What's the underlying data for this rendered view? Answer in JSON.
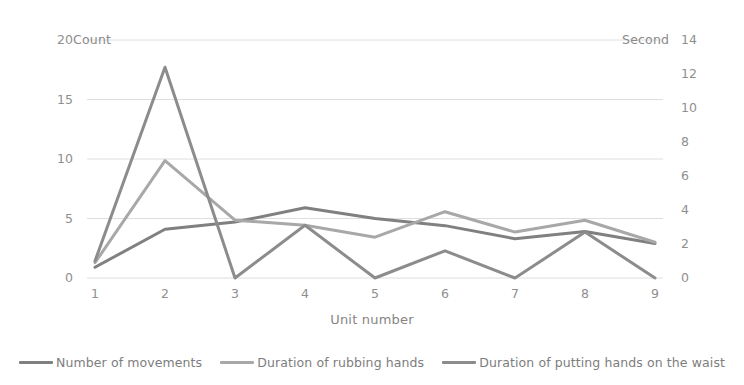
{
  "chart_data": {
    "type": "line",
    "title": "",
    "xlabel": "Unit number",
    "left_axis_caption": "Count",
    "right_axis_caption": "Second",
    "x": [
      1,
      2,
      3,
      4,
      5,
      6,
      7,
      8,
      9
    ],
    "xticklabels": [
      "1",
      "2",
      "3",
      "4",
      "5",
      "6",
      "7",
      "8",
      "9"
    ],
    "left_ticks": [
      0,
      5,
      10,
      15,
      20
    ],
    "left_ticklabels": [
      "0",
      "5",
      "10",
      "15",
      "20"
    ],
    "right_ticks": [
      0,
      2,
      4,
      6,
      8,
      10,
      12,
      14
    ],
    "right_ticklabels": [
      "0",
      "2",
      "4",
      "6",
      "8",
      "10",
      "12",
      "14"
    ],
    "ylim_left": [
      0,
      20
    ],
    "ylim_right": [
      0,
      14
    ],
    "grid": true,
    "legend_position": "bottom",
    "series": [
      {
        "name": "Number of movements",
        "axis": "left",
        "color": "#808080",
        "values": [
          0.9,
          4.1,
          4.7,
          5.9,
          5.0,
          4.4,
          3.3,
          3.9,
          2.9
        ]
      },
      {
        "name": "Duration of rubbing hands",
        "axis": "right",
        "color": "#a8a8a8",
        "values": [
          0.9,
          6.9,
          3.4,
          3.1,
          2.4,
          3.9,
          2.7,
          3.4,
          2.1
        ]
      },
      {
        "name": "Duration of putting hands on the waist",
        "axis": "right",
        "color": "#8c8c8c",
        "values": [
          1.0,
          12.4,
          0.0,
          3.1,
          0.0,
          1.6,
          0.0,
          2.7,
          0.0
        ]
      }
    ]
  }
}
